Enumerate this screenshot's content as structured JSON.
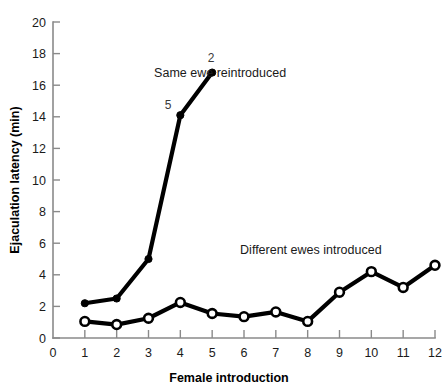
{
  "chart_data": {
    "type": "line",
    "title": "",
    "xlabel": "Female introduction",
    "ylabel": "Ejaculation latency (min)",
    "xlim": [
      0,
      12
    ],
    "ylim": [
      0,
      20
    ],
    "xticks": [
      0,
      1,
      2,
      3,
      4,
      5,
      6,
      7,
      8,
      9,
      10,
      11,
      12
    ],
    "yticks": [
      0,
      2,
      4,
      6,
      8,
      10,
      12,
      14,
      16,
      18,
      20
    ],
    "grid": false,
    "legend_position": "inline-annotations",
    "series": [
      {
        "name": "Same ewe reintroduced",
        "marker": "filled-circle",
        "x": [
          1,
          2,
          3,
          4,
          5
        ],
        "values": [
          2.2,
          2.5,
          5.0,
          14.1,
          16.8
        ],
        "point_labels": [
          null,
          null,
          null,
          "5",
          "2"
        ]
      },
      {
        "name": "Different ewes introduced",
        "marker": "open-circle",
        "x": [
          1,
          2,
          3,
          4,
          5,
          6,
          7,
          8,
          9,
          10,
          11,
          12
        ],
        "values": [
          1.05,
          0.85,
          1.25,
          2.25,
          1.55,
          1.35,
          1.65,
          1.05,
          2.9,
          4.2,
          3.2,
          4.6
        ],
        "point_labels": [
          null,
          null,
          null,
          null,
          null,
          null,
          null,
          null,
          null,
          null,
          null,
          null
        ]
      }
    ],
    "annotations": [
      {
        "text": "Same ewe reintroduced",
        "x": 5.25,
        "y": 16.75
      },
      {
        "text": "Different ewes introduced",
        "x": 8.1,
        "y": 5.6
      }
    ],
    "colors": {
      "line": "#000000",
      "axis": "#8a8a8a",
      "text": "#1a1a1a",
      "background": "#ffffff"
    }
  }
}
